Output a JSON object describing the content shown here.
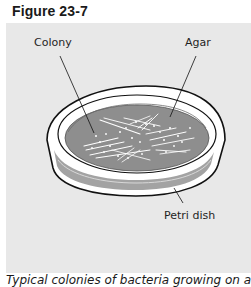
{
  "figure": {
    "title": "Figure 23-7",
    "labels": {
      "colony": "Colony",
      "agar": "Agar",
      "petri_dish": "Petri dish"
    },
    "caption": "Typical colonies of bacteria growing on agar"
  },
  "colors": {
    "panel_background": "#e8e8e8",
    "agar": "#8c8c8c",
    "dish_wall": "#a6a6a6",
    "dish_rim": "#ffffff",
    "outline": "#111111",
    "colony": "#ffffff"
  }
}
